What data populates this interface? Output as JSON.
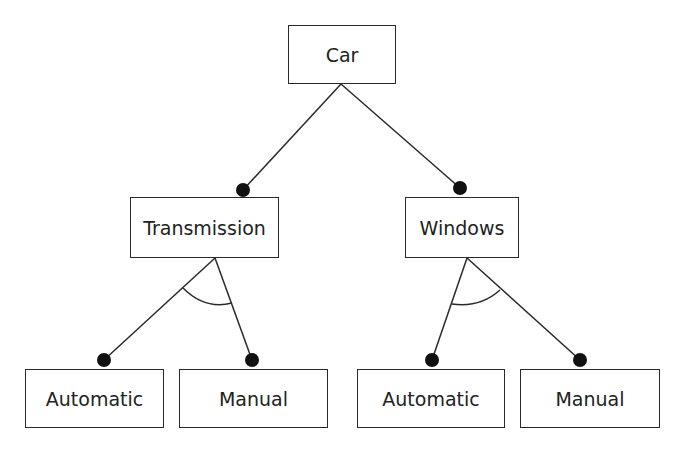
{
  "diagram": {
    "type": "feature-model",
    "nodes": {
      "car": {
        "label": "Car",
        "x": 288,
        "y": 25,
        "w": 108,
        "h": 59
      },
      "transmission": {
        "label": "Transmission",
        "x": 130,
        "y": 197,
        "w": 149,
        "h": 61
      },
      "windows": {
        "label": "Windows",
        "x": 405,
        "y": 197,
        "w": 114,
        "h": 61
      },
      "trans_automatic": {
        "label": "Automatic",
        "x": 25,
        "y": 369,
        "w": 139,
        "h": 59
      },
      "trans_manual": {
        "label": "Manual",
        "x": 179,
        "y": 369,
        "w": 149,
        "h": 59
      },
      "win_automatic": {
        "label": "Automatic",
        "x": 357,
        "y": 369,
        "w": 148,
        "h": 59
      },
      "win_manual": {
        "label": "Manual",
        "x": 520,
        "y": 369,
        "w": 140,
        "h": 59
      }
    },
    "edges": [
      {
        "from": "car",
        "to": "transmission",
        "x1": 341,
        "y1": 84,
        "x2": 243,
        "y2": 190,
        "mandatory": true
      },
      {
        "from": "car",
        "to": "windows",
        "x1": 341,
        "y1": 84,
        "x2": 460,
        "y2": 188,
        "mandatory": true
      },
      {
        "from": "transmission",
        "to": "trans_automatic",
        "x1": 215,
        "y1": 258,
        "x2": 104,
        "y2": 360,
        "mandatory": true
      },
      {
        "from": "transmission",
        "to": "trans_manual",
        "x1": 215,
        "y1": 258,
        "x2": 252,
        "y2": 360,
        "mandatory": true
      },
      {
        "from": "windows",
        "to": "win_automatic",
        "x1": 467,
        "y1": 258,
        "x2": 432,
        "y2": 360,
        "mandatory": true
      },
      {
        "from": "windows",
        "to": "win_manual",
        "x1": 467,
        "y1": 258,
        "x2": 580,
        "y2": 360,
        "mandatory": true
      }
    ],
    "groups": [
      {
        "parent": "transmission",
        "kind": "alternative",
        "arc": "M 183 288 Q 205 310 232 303"
      },
      {
        "parent": "windows",
        "kind": "alternative",
        "arc": "M 452 304 Q 480 308 500 290"
      }
    ],
    "style": {
      "stroke": "#2a2a2a",
      "dot_fill": "#111111",
      "dot_radius": 7
    }
  }
}
